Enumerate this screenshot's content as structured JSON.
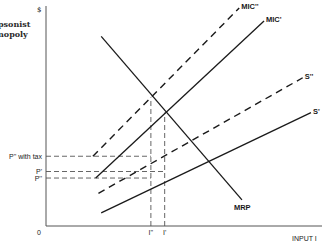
{
  "chart_data": {
    "type": "line",
    "title_lines": [
      "Monopsonist",
      "Monopoly"
    ],
    "title_visible_lines": [
      "psonist",
      "nopoly"
    ],
    "ylabel": "$",
    "xlabel": "INPUT I",
    "origin_label": "0",
    "xlim": [
      0,
      100
    ],
    "ylim": [
      0,
      100
    ],
    "grid": false,
    "legend": "none",
    "series": [
      {
        "name": "MRP",
        "style": "solid",
        "points": [
          [
            20,
            87
          ],
          [
            71,
            12
          ]
        ],
        "label": "MRP",
        "label_at": "end"
      },
      {
        "name": "MIC''",
        "style": "dashed",
        "points": [
          [
            17,
            32
          ],
          [
            70,
            100
          ]
        ],
        "label": "MIC''",
        "label_at": "end"
      },
      {
        "name": "MIC'",
        "style": "solid",
        "points": [
          [
            18,
            22
          ],
          [
            79,
            94
          ]
        ],
        "label": "MIC'",
        "label_at": "end"
      },
      {
        "name": "S''",
        "style": "dashed",
        "points": [
          [
            19,
            15
          ],
          [
            93,
            68
          ]
        ],
        "label": "S''",
        "label_at": "end"
      },
      {
        "name": "S'",
        "style": "solid",
        "points": [
          [
            20,
            6
          ],
          [
            96,
            52
          ]
        ],
        "label": "S'",
        "label_at": "end"
      }
    ],
    "reference_lines": [
      {
        "axis": "y",
        "value": 32,
        "label": "P'' with tax",
        "x_end": 38
      },
      {
        "axis": "y",
        "value": 25,
        "label": "P'",
        "x_end": 43
      },
      {
        "axis": "y",
        "value": 22,
        "label": "P''",
        "x_end": 38
      },
      {
        "axis": "x",
        "value": 38,
        "label": "I''",
        "y_end": 59
      },
      {
        "axis": "x",
        "value": 43,
        "label": "I'",
        "y_end": 52
      }
    ]
  }
}
